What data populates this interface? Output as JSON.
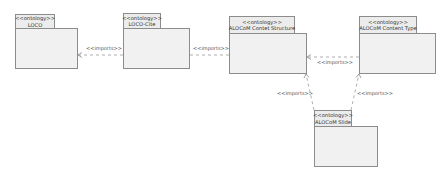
{
  "diagram": {
    "type": "UML package diagram",
    "colors": {
      "fill": "#f1f1f1",
      "tab_fill": "#ececec",
      "border": "#8c8c8c",
      "edge": "#999999",
      "text": "#333333"
    },
    "packages": [
      {
        "id": "loco",
        "stereotype": "<<ontology>>",
        "name": "LOCO"
      },
      {
        "id": "loco_cite",
        "stereotype": "<<ontology>>",
        "name": "LOCO-Cite"
      },
      {
        "id": "alocom_cs",
        "stereotype": "<<ontology>>",
        "name": "ALOCoM Contet Structure"
      },
      {
        "id": "alocom_ct",
        "stereotype": "<<ontology>>",
        "name": "ALOCoM Content Type"
      },
      {
        "id": "alocom_slide",
        "stereotype": "<<ontology>>",
        "name": "ALOCoM Slide"
      }
    ],
    "relations": [
      {
        "from": "LOCO-Cite",
        "to": "LOCO",
        "label": "<<imports>>"
      },
      {
        "from": "ALOCoM Contet Structure",
        "to": "LOCO-Cite",
        "label": "<<imports>>"
      },
      {
        "from": "ALOCoM Content Type",
        "to": "ALOCoM Contet Structure",
        "label": "<<imports>>"
      },
      {
        "from": "ALOCoM Slide",
        "to": "ALOCoM Contet Structure",
        "label": "<<imports>>"
      },
      {
        "from": "ALOCoM Slide",
        "to": "ALOCoM Content Type",
        "label": "<<imports>>"
      }
    ]
  }
}
